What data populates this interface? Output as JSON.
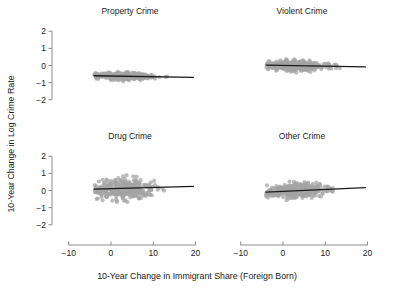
{
  "figure": {
    "y_axis_label": "10-Year Change in Log Crime Rate",
    "x_axis_label": "10-Year Change in Immigrant Share (Foreign Born)"
  },
  "chart_data": {
    "type": "scatter",
    "title": "",
    "xlabel": "10-Year Change in Immigrant Share (Foreign Born)",
    "ylabel": "10-Year Change in Log Crime Rate",
    "grid": false,
    "legend": false,
    "xlim": [
      -13,
      22
    ],
    "ylim": [
      -2.6,
      2.6
    ],
    "xticks": [
      -10,
      0,
      10,
      20
    ],
    "xtick_labels": [
      "−10",
      "0",
      "10",
      "20"
    ],
    "yticks": [
      2,
      1,
      0,
      -1,
      -2
    ],
    "ytick_labels": [
      "2",
      "1",
      "0",
      "−1",
      "−2"
    ],
    "layout": "2x2 panel grid, shared axes",
    "panels": [
      {
        "title": "Property Crime",
        "row": 0,
        "col": 0,
        "fit_line": {
          "x": [
            -4.0,
            19.5
          ],
          "y": [
            -0.6,
            -0.69
          ],
          "slope": -0.0038,
          "intercept": -0.615
        },
        "n_points": 330,
        "cloud": {
          "x_center": 3.0,
          "x_spread": 5.2,
          "y_center": -0.62,
          "y_spread": 0.16,
          "x_min": -4.0,
          "x_max": 19.5
        }
      },
      {
        "title": "Violent Crime",
        "row": 0,
        "col": 1,
        "fit_line": {
          "x": [
            -4.0,
            19.5
          ],
          "y": [
            0.02,
            -0.08
          ],
          "slope": -0.0043,
          "intercept": 0.003
        },
        "n_points": 330,
        "cloud": {
          "x_center": 3.0,
          "x_spread": 5.2,
          "y_center": -0.02,
          "y_spread": 0.24,
          "x_min": -4.0,
          "x_max": 19.5
        }
      },
      {
        "title": "Drug Crime",
        "row": 1,
        "col": 0,
        "fit_line": {
          "x": [
            -4.0,
            19.5
          ],
          "y": [
            0.08,
            0.24
          ],
          "slope": 0.0068,
          "intercept": 0.107
        },
        "n_points": 330,
        "cloud": {
          "x_center": 3.0,
          "x_spread": 5.2,
          "y_center": 0.08,
          "y_spread": 0.47,
          "x_min": -4.0,
          "x_max": 19.5
        }
      },
      {
        "title": "Other Crime",
        "row": 1,
        "col": 1,
        "fit_line": {
          "x": [
            -4.0,
            19.5
          ],
          "y": [
            -0.09,
            0.17
          ],
          "slope": 0.0111,
          "intercept": -0.046
        },
        "n_points": 330,
        "cloud": {
          "x_center": 3.0,
          "x_spread": 5.2,
          "y_center": -0.03,
          "y_spread": 0.33,
          "x_min": -4.0,
          "x_max": 19.5
        }
      }
    ]
  }
}
